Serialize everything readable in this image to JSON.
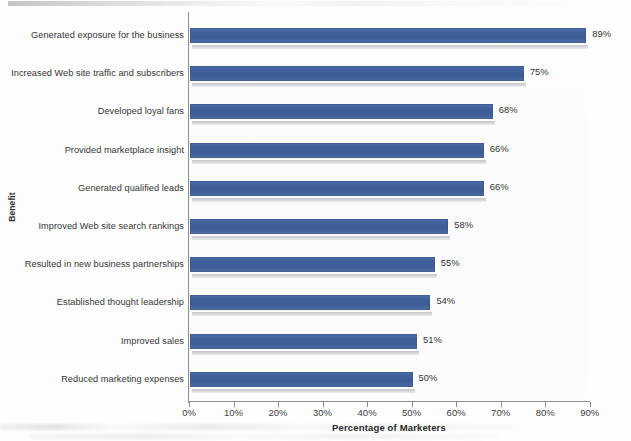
{
  "chart_data": {
    "type": "bar",
    "orientation": "horizontal",
    "title": "",
    "xlabel": "Percentage of Marketers",
    "ylabel": "Benefit",
    "xlim": [
      0,
      90
    ],
    "xtick_labels": [
      "0%",
      "10%",
      "20%",
      "30%",
      "40%",
      "50%",
      "60%",
      "70%",
      "80%",
      "90%"
    ],
    "xtick_values": [
      0,
      10,
      20,
      30,
      40,
      50,
      60,
      70,
      80,
      90
    ],
    "grid": false,
    "legend": false,
    "bar_color": "#41619c",
    "categories": [
      "Generated exposure for the business",
      "Increased Web site traffic and subscribers",
      "Developed loyal fans",
      "Provided marketplace insight",
      "Generated qualified leads",
      "Improved Web site search rankings",
      "Resulted in new business partnerships",
      "Established thought leadership",
      "Improved sales",
      "Reduced marketing expenses"
    ],
    "values": [
      89,
      75,
      68,
      66,
      66,
      58,
      55,
      54,
      51,
      50
    ],
    "data_labels": [
      "89%",
      "75%",
      "68%",
      "66%",
      "66%",
      "58%",
      "55%",
      "54%",
      "51%",
      "50%"
    ]
  }
}
